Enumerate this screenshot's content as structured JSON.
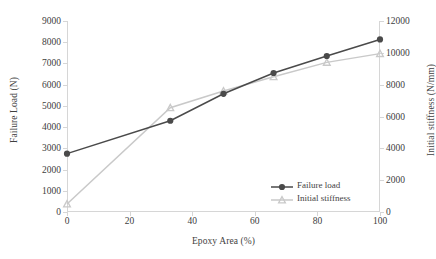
{
  "chart_data": {
    "type": "line",
    "title": "",
    "xlabel": "Epoxy Area (%)",
    "ylabel": "Failure Load (N)",
    "y2label": "Initial stiffness (N/mm)",
    "x": [
      0,
      33,
      50,
      66,
      83,
      100
    ],
    "xlim": [
      0,
      100
    ],
    "ylim": [
      0,
      9000
    ],
    "y2lim": [
      0,
      12000
    ],
    "xticks": [
      "0",
      "20",
      "40",
      "60",
      "80",
      "100"
    ],
    "xtick_values": [
      0,
      20,
      40,
      60,
      80,
      100
    ],
    "yticks": [
      "0",
      "1000",
      "2000",
      "3000",
      "4000",
      "5000",
      "6000",
      "7000",
      "8000",
      "9000"
    ],
    "ytick_values": [
      0,
      1000,
      2000,
      3000,
      4000,
      5000,
      6000,
      7000,
      8000,
      9000
    ],
    "y2ticks": [
      "0",
      "2000",
      "4000",
      "6000",
      "8000",
      "10000",
      "12000"
    ],
    "y2tick_values": [
      0,
      2000,
      4000,
      6000,
      8000,
      10000,
      12000
    ],
    "grid": false,
    "legend_position": "inside-lower-right",
    "series": [
      {
        "name": "Failure load",
        "axis": "left",
        "color": "#4a4a4a",
        "marker": "circle",
        "values": [
          2750,
          4300,
          5570,
          6550,
          7350,
          8130
        ]
      },
      {
        "name": "Initial stiffness",
        "axis": "right",
        "color": "#c9c9c9",
        "marker": "triangle",
        "values": [
          500,
          6550,
          7600,
          8500,
          9400,
          9950
        ]
      }
    ]
  }
}
